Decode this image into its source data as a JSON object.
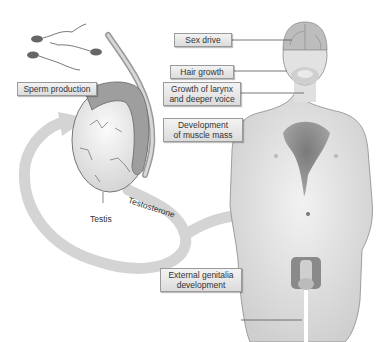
{
  "diagram": {
    "labels": {
      "sperm_production": "Sperm production",
      "testis": "Testis",
      "testosterone": "Testosterone",
      "sex_drive": "Sex drive",
      "hair_growth": "Hair growth",
      "larynx_line1": "Growth of larynx",
      "larynx_line2": "and deeper voice",
      "muscle_line1": "Development",
      "muscle_line2": "of muscle mass",
      "genitalia_line1": "External genitalia",
      "genitalia_line2": "development"
    },
    "colors": {
      "body_fill": "#e6e6e6",
      "highlight": "#7a7a7a",
      "arrow": "#d6d6d6",
      "label_bg": "#e6e6e6",
      "label_border": "#9a9a9a"
    }
  }
}
